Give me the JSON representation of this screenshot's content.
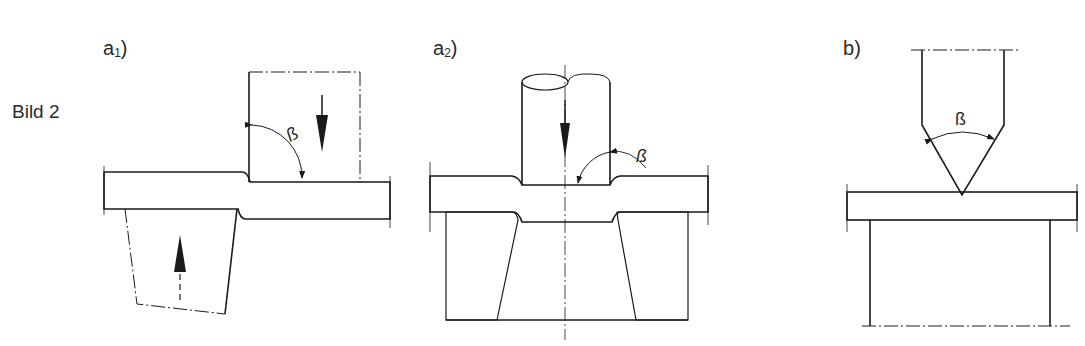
{
  "figure": {
    "title": "Bild 2",
    "beta_symbol": "ß",
    "panels": [
      {
        "id": "a1",
        "label": "a",
        "subscript": "1",
        "close": ")",
        "description": "Scherschneiden mit Ober- und Untermesser, Schneidwinkel ß"
      },
      {
        "id": "a2",
        "label": "a",
        "subscript": "2",
        "close": ")",
        "description": "Lochen mit Stempel und Schneidplatte, Schneidwinkel ß"
      },
      {
        "id": "b",
        "label": "b",
        "subscript": "",
        "close": ")",
        "description": "Keilschneiden mit Schneidkeil, Keilwinkel ß"
      }
    ]
  },
  "colors": {
    "line": "#1a1a1a",
    "material_fill": "#f2f2f2",
    "text": "#2a2a2a"
  }
}
